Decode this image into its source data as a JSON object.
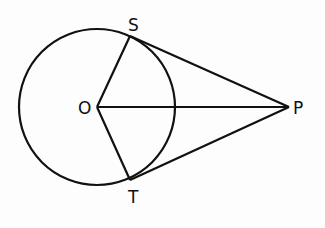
{
  "diagram": {
    "type": "circle-with-tangents",
    "labels": {
      "center": "O",
      "tangent_point_top": "S",
      "tangent_point_bottom": "T",
      "external_point": "P"
    },
    "segments": [
      "OS",
      "OT",
      "OP",
      "PS",
      "PT"
    ],
    "stroke_color": "#111111",
    "background": "#fdfdfd"
  }
}
